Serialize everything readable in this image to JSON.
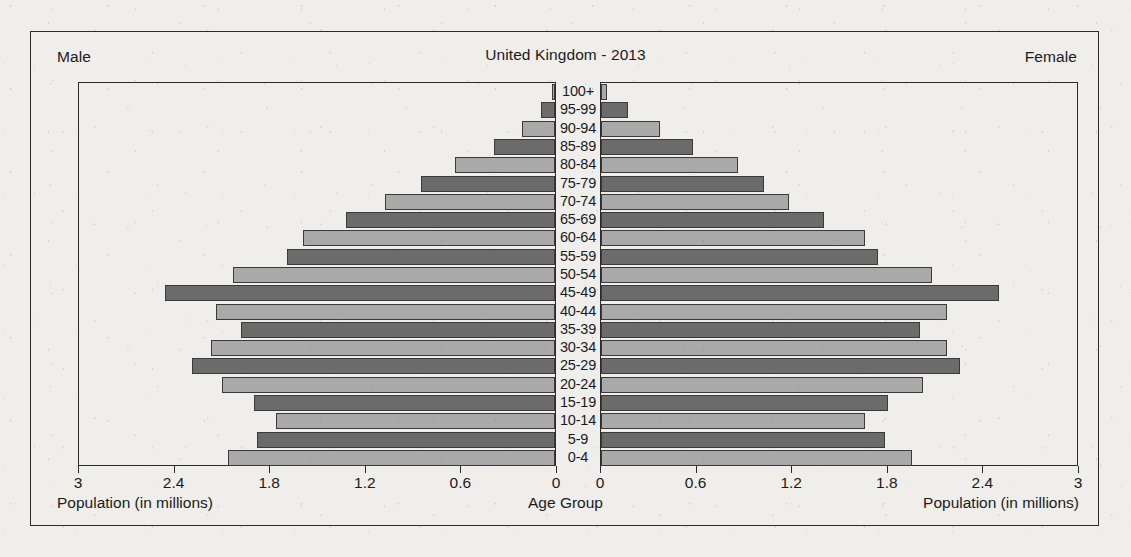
{
  "chart": {
    "title": "United Kingdom - 2013",
    "male_label": "Male",
    "female_label": "Female",
    "left_axis_title": "Population (in millions)",
    "center_axis_title": "Age Group",
    "right_axis_title": "Population (in millions)"
  },
  "colors": {
    "bar_dark": "#6b6b6b",
    "bar_light": "#a9a9a9",
    "outline": "#2b2b2b",
    "paper": "#efeeeb"
  },
  "chart_data": {
    "type": "bar",
    "subtype": "population-pyramid",
    "title": "United Kingdom - 2013",
    "xlabel": "Population (in millions)",
    "ylabel": "Age Group",
    "center_label": "Age Group",
    "grid": false,
    "legend_position": "none",
    "xlim": [
      0,
      3
    ],
    "xticks": [
      3,
      2.4,
      1.8,
      1.2,
      0.6,
      0
    ],
    "xticks_left": [
      "3",
      "2.4",
      "1.8",
      "1.2",
      "0.6",
      "0"
    ],
    "xticks_right": [
      "0",
      "0.6",
      "1.2",
      "1.8",
      "2.4",
      "3"
    ],
    "categories": [
      "100+",
      "95-99",
      "90-94",
      "85-89",
      "80-84",
      "75-79",
      "70-74",
      "65-69",
      "60-64",
      "55-59",
      "50-54",
      "45-49",
      "40-44",
      "35-39",
      "30-34",
      "25-29",
      "20-24",
      "15-19",
      "10-14",
      "5-9",
      "0-4"
    ],
    "series": [
      {
        "name": "Male",
        "side": "left",
        "values": [
          0.02,
          0.09,
          0.21,
          0.38,
          0.63,
          0.84,
          1.07,
          1.31,
          1.58,
          1.68,
          2.02,
          2.45,
          2.13,
          1.97,
          2.16,
          2.28,
          2.09,
          1.89,
          1.75,
          1.87,
          2.05
        ]
      },
      {
        "name": "Female",
        "side": "right",
        "values": [
          0.04,
          0.17,
          0.37,
          0.58,
          0.86,
          1.02,
          1.18,
          1.4,
          1.66,
          1.74,
          2.08,
          2.5,
          2.17,
          2.0,
          2.17,
          2.25,
          2.02,
          1.8,
          1.66,
          1.78,
          1.95
        ]
      }
    ]
  }
}
